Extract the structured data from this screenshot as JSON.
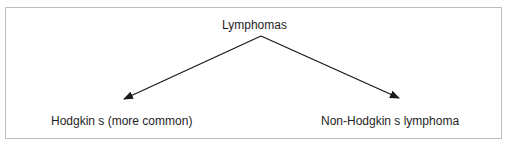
{
  "diagram": {
    "root": {
      "label": "Lymphomas"
    },
    "children": [
      {
        "label": "Hodgkin s (more common)"
      },
      {
        "label": "Non-Hodgkin s lymphoma"
      }
    ],
    "edges": [
      {
        "from": "Lymphomas",
        "to": "Hodgkin s (more common)",
        "type": "arrow"
      },
      {
        "from": "Lymphomas",
        "to": "Non-Hodgkin s lymphoma",
        "type": "arrow"
      }
    ],
    "colors": {
      "border": "#bdbdbd",
      "line": "#1a1a1a",
      "text": "#1e1e1e",
      "background": "#ffffff"
    }
  }
}
